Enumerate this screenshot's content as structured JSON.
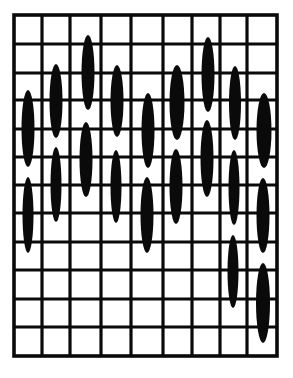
{
  "diagram": {
    "type": "stitch-grid-pattern",
    "background": "#ffffff",
    "ink": "#0a0a0a",
    "grid": {
      "columns": 9,
      "rows": 12,
      "x_lines": [
        14,
        42,
        70,
        101,
        131,
        163,
        192,
        220,
        247,
        277
      ],
      "y_lines": [
        15,
        44,
        73,
        100,
        129,
        157,
        185,
        213,
        242,
        270,
        299,
        327,
        356
      ],
      "line_width": 3.2,
      "border_width": 3.6
    },
    "stitches": [
      {
        "column": 1,
        "cx": 28,
        "top": 90,
        "bottom": 167,
        "width": 13
      },
      {
        "column": 1,
        "cx": 28,
        "top": 177,
        "bottom": 253,
        "width": 11
      },
      {
        "column": 2,
        "cx": 56,
        "top": 64,
        "bottom": 138,
        "width": 13
      },
      {
        "column": 2,
        "cx": 56,
        "top": 147,
        "bottom": 222,
        "width": 11
      },
      {
        "column": 3,
        "cx": 88,
        "top": 35,
        "bottom": 110,
        "width": 13
      },
      {
        "column": 3,
        "cx": 86,
        "top": 122,
        "bottom": 197,
        "width": 13
      },
      {
        "column": 4,
        "cx": 117,
        "top": 65,
        "bottom": 137,
        "width": 13
      },
      {
        "column": 4,
        "cx": 116,
        "top": 150,
        "bottom": 223,
        "width": 11
      },
      {
        "column": 5,
        "cx": 148,
        "top": 93,
        "bottom": 168,
        "width": 13
      },
      {
        "column": 5,
        "cx": 147,
        "top": 177,
        "bottom": 253,
        "width": 13
      },
      {
        "column": 6,
        "cx": 177,
        "top": 65,
        "bottom": 140,
        "width": 15
      },
      {
        "column": 6,
        "cx": 176,
        "top": 149,
        "bottom": 224,
        "width": 13
      },
      {
        "column": 7,
        "cx": 208,
        "top": 37,
        "bottom": 112,
        "width": 13
      },
      {
        "column": 7,
        "cx": 207,
        "top": 120,
        "bottom": 197,
        "width": 13
      },
      {
        "column": 8,
        "cx": 235,
        "top": 66,
        "bottom": 140,
        "width": 12
      },
      {
        "column": 8,
        "cx": 234,
        "top": 150,
        "bottom": 225,
        "width": 11
      },
      {
        "column": 8,
        "cx": 233,
        "top": 235,
        "bottom": 308,
        "width": 11
      },
      {
        "column": 9,
        "cx": 264,
        "top": 93,
        "bottom": 168,
        "width": 15
      },
      {
        "column": 9,
        "cx": 263,
        "top": 178,
        "bottom": 253,
        "width": 13
      },
      {
        "column": 9,
        "cx": 263,
        "top": 263,
        "bottom": 343,
        "width": 14
      }
    ]
  }
}
